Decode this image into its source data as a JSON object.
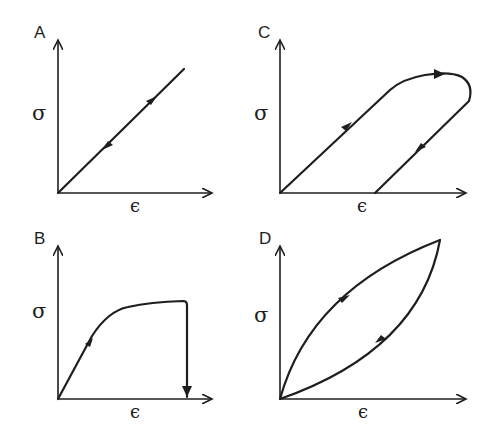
{
  "figure": {
    "panels": [
      {
        "id": "A",
        "label": "A",
        "y_label": "σ",
        "x_label": "ϵ",
        "description": "linear elastic: loading and unloading along the same straight line"
      },
      {
        "id": "C",
        "label": "C",
        "y_label": "σ",
        "x_label": "ϵ",
        "description": "elastic-plastic loop: unloading returns along parallel line leaving permanent strain"
      },
      {
        "id": "B",
        "label": "B",
        "y_label": "σ",
        "x_label": "ϵ",
        "description": "yielding curve with plateau, then sudden drop to zero (fracture)"
      },
      {
        "id": "D",
        "label": "D",
        "y_label": "σ",
        "x_label": "ϵ",
        "description": "viscoelastic hysteresis loop: loading curve above unloading curve"
      }
    ]
  },
  "colors": {
    "ink": "#1e1e1e",
    "background": "#ffffff"
  }
}
